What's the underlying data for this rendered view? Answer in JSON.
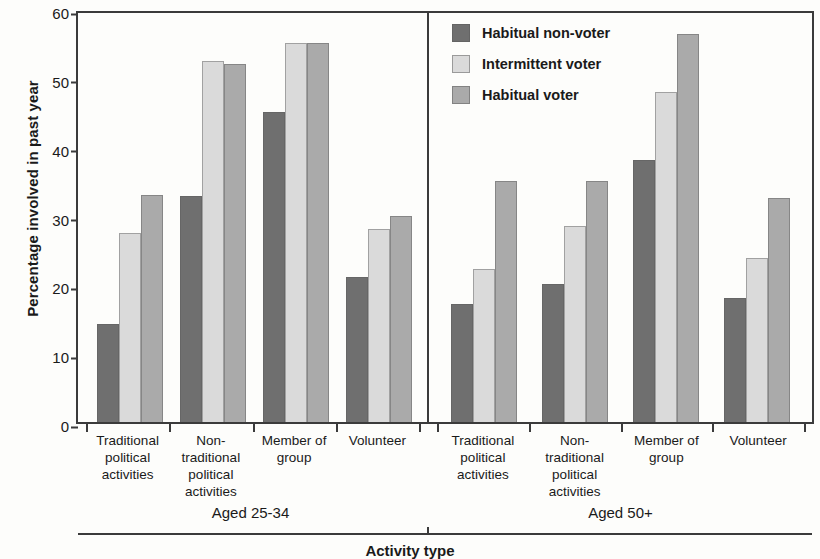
{
  "chart_data": {
    "type": "bar",
    "title": "",
    "xlabel": "Activity type",
    "ylabel": "Percentage involved in past year",
    "ylim": [
      0,
      60
    ],
    "yticks": [
      0,
      10,
      20,
      30,
      40,
      50,
      60
    ],
    "grid": false,
    "legend_position": "top-center-right",
    "categories": [
      "Traditional\npolitical\nactivities",
      "Non-\ntraditional\npolitical\nactivities",
      "Member of\ngroup",
      "Volunteer"
    ],
    "panels": [
      {
        "name": "Aged 25-34",
        "series": [
          {
            "name": "Habitual non-voter",
            "values": [
              14.3,
              32.8,
              45.0,
              21.0
            ]
          },
          {
            "name": "Intermittent voter",
            "values": [
              27.5,
              52.5,
              55.0,
              28.0
            ]
          },
          {
            "name": "Habitual voter",
            "values": [
              33.0,
              52.0,
              55.0,
              30.0
            ]
          }
        ]
      },
      {
        "name": "Aged 50+",
        "series": [
          {
            "name": "Habitual non-voter",
            "values": [
              17.2,
              20.0,
              38.0,
              18.0
            ]
          },
          {
            "name": "Intermittent voter",
            "values": [
              22.3,
              28.5,
              48.0,
              23.8
            ]
          },
          {
            "name": "Habitual voter",
            "values": [
              35.0,
              35.0,
              56.3,
              32.5
            ]
          }
        ]
      }
    ],
    "legend": [
      {
        "label": "Habitual non-voter",
        "color": "#6f6f6f"
      },
      {
        "label": "Intermittent voter",
        "color": "#dadada"
      },
      {
        "label": "Habitual voter",
        "color": "#aaaaaa"
      }
    ],
    "series_colors": [
      "#6f6f6f",
      "#dadada",
      "#aaaaaa"
    ],
    "axis_color": "#3b3b3b",
    "background_color": "#fdfdfb"
  }
}
